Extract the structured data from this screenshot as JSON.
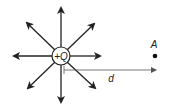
{
  "diagram": {
    "charge": {
      "label": "+Q",
      "cx": 61,
      "cy": 56,
      "r": 9
    },
    "field_arrows": [
      {
        "name": "up",
        "x1": 61,
        "y1": 47,
        "x2": 61,
        "y2": 8
      },
      {
        "name": "up-right",
        "x1": 67,
        "y1": 50,
        "x2": 94,
        "y2": 24
      },
      {
        "name": "right",
        "x1": 70,
        "y1": 56,
        "x2": 100,
        "y2": 56
      },
      {
        "name": "down-right",
        "x1": 67,
        "y1": 62,
        "x2": 95,
        "y2": 88
      },
      {
        "name": "down",
        "x1": 61,
        "y1": 65,
        "x2": 61,
        "y2": 102
      },
      {
        "name": "down-left",
        "x1": 55,
        "y1": 62,
        "x2": 28,
        "y2": 88
      },
      {
        "name": "left",
        "x1": 52,
        "y1": 56,
        "x2": 14,
        "y2": 56
      },
      {
        "name": "up-left",
        "x1": 55,
        "y1": 50,
        "x2": 27,
        "y2": 23
      }
    ],
    "point": {
      "label": "A",
      "cx": 155,
      "cy": 56
    },
    "distance": {
      "label": "d",
      "x1": 64,
      "y1": 70,
      "x2": 156,
      "y2": 70
    },
    "colors": {
      "arrow": "#222222",
      "distance_line": "#555555",
      "point": "#111111"
    }
  }
}
